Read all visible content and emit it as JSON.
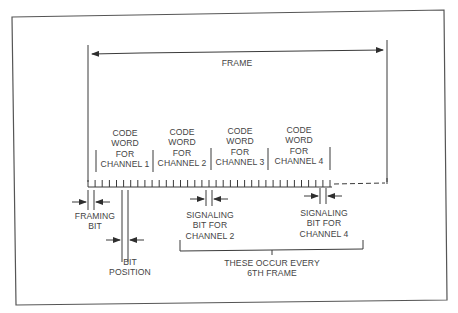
{
  "diagram": {
    "title": "FRAME",
    "code_words": [
      {
        "lines": [
          "CODE",
          "WORD",
          "FOR",
          "CHANNEL 1"
        ]
      },
      {
        "lines": [
          "CODE",
          "WORD",
          "FOR",
          "CHANNEL 2"
        ]
      },
      {
        "lines": [
          "CODE",
          "WORD",
          "FOR",
          "CHANNEL 3"
        ]
      },
      {
        "lines": [
          "CODE",
          "WORD",
          "FOR",
          "CHANNEL 4"
        ]
      }
    ],
    "framing_bit": {
      "lines": [
        "FRAMING",
        "BIT"
      ]
    },
    "bit_position": {
      "lines": [
        "BIT",
        "POSITION"
      ]
    },
    "signaling_ch2": {
      "lines": [
        "SIGNALING",
        "BIT FOR",
        "CHANNEL 2"
      ]
    },
    "signaling_ch4": {
      "lines": [
        "SIGNALING",
        "BIT FOR",
        "CHANNEL 4"
      ]
    },
    "bracket_note": {
      "lines": [
        "THESE OCCUR EVERY",
        "6TH FRAME"
      ]
    },
    "colors": {
      "line": "#3a3a3a",
      "text": "#444444",
      "background": "#ffffff"
    }
  }
}
